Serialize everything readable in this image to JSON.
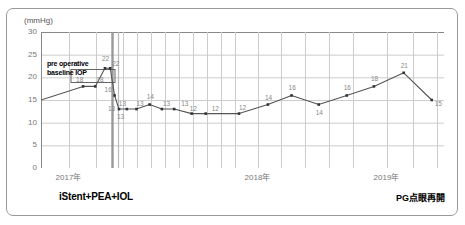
{
  "chart_data": {
    "type": "line",
    "title": "",
    "xlabel": "",
    "ylabel": "(mmHg)",
    "yunit": "(mmHg)",
    "ylim": [
      0,
      30
    ],
    "ytick_labels": [
      "30",
      "25",
      "20",
      "15",
      "10",
      "5",
      "0"
    ],
    "ytick_values": [
      30,
      25,
      20,
      15,
      10,
      5,
      0
    ],
    "xtick_labels": [
      "2017年",
      "2018年",
      "2019年"
    ],
    "xtick_values": [
      2017,
      2018,
      2019
    ],
    "grid": true,
    "legend": "none",
    "series": [
      {
        "name": "IOP",
        "point_labels": [
          "",
          "18",
          "18",
          "22",
          "22",
          "16",
          "13",
          "13",
          "13",
          "14",
          "13",
          "13",
          "12",
          "12",
          "12",
          "14",
          "16",
          "14",
          "16",
          "18",
          "21",
          "15"
        ],
        "values": [
          15,
          18,
          18,
          22,
          22,
          16,
          13,
          13,
          13,
          14,
          13,
          13,
          12,
          12,
          12,
          14,
          16,
          14,
          16,
          18,
          21,
          15
        ],
        "x": [
          0.0,
          4.8,
          6.2,
          7.3,
          7.9,
          8.4,
          8.9,
          9.8,
          10.9,
          12.4,
          13.8,
          15.2,
          17.2,
          18.8,
          22.6,
          25.9,
          28.6,
          31.7,
          34.9,
          38.0,
          41.4,
          44.6
        ]
      }
    ],
    "annotations": [
      {
        "text_line1": "pre operative",
        "text_line2": "baseline IOP"
      }
    ],
    "markers": [
      {
        "name": "surgery-line",
        "label": "iStent+PEA+IOL"
      },
      {
        "name": "restart-line",
        "label": "PG点眼再開"
      }
    ]
  },
  "captions": {
    "left": "iStent+PEA+IOL",
    "right": "PG点眼再開"
  },
  "colors": {
    "line": "#555555",
    "grid": "#cccccc",
    "axis": "#888888",
    "marker": "#333333",
    "label": "#888888",
    "frame": "#9a9a9a"
  }
}
